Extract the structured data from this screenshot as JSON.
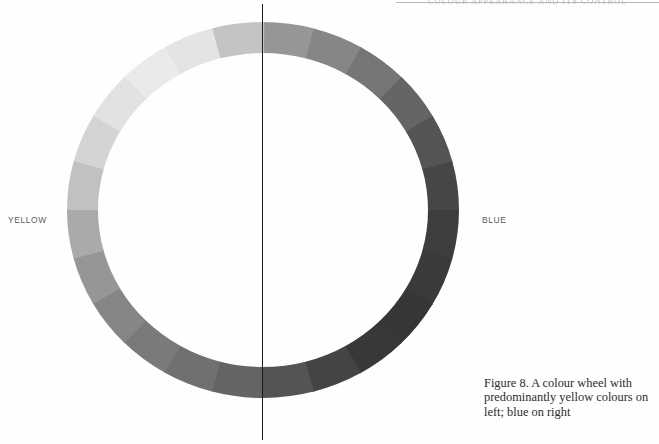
{
  "page": {
    "background_color": "#fefefe",
    "header_rule_color": "#b9b9bd",
    "running_header": "COLOUR APPEARANCE AND ITS CONTROL",
    "divider_color": "#1a1a1a"
  },
  "labels": {
    "left": "YELLOW",
    "right": "BLUE",
    "label_color": "#5b5b5f"
  },
  "caption": {
    "line1": "Figure 8. A colour wheel with",
    "line2": "predominantly yellow colours on",
    "line3": "left; blue on right",
    "full_text": "Figure 8. A colour wheel with predominantly yellow colours on left; blue on right",
    "text_color": "#2b2b2e"
  },
  "chart_data": {
    "type": "pie",
    "title": "A colour wheel with predominantly yellow colours on left; blue on right",
    "subtitle": "",
    "xlabel": "",
    "ylabel": "",
    "legend_position": "sides",
    "grid": false,
    "rendering": "greyscale scan of a colour wheel; lightness encodes the original hue",
    "geometry": {
      "center_x": 199,
      "center_y": 191,
      "outer_radius_x": 196,
      "outer_radius_y": 188,
      "ring_thickness": 31,
      "segment_count": 24,
      "segment_degrees": 15,
      "start_angle_deg": -90
    },
    "annotations": [
      {
        "text": "YELLOW",
        "side": "left",
        "angle_deg": 180
      },
      {
        "text": "BLUE",
        "side": "right",
        "angle_deg": 0
      },
      {
        "text": "vertical divider",
        "angle_deg": 90,
        "color": "#1a1a1a"
      }
    ],
    "categories": [
      "0 (top)",
      "15",
      "30",
      "45",
      "60",
      "75",
      "90 (right / BLUE)",
      "105",
      "120",
      "135",
      "150",
      "165",
      "180 (bottom)",
      "195",
      "210",
      "225",
      "240",
      "255",
      "270 (left / YELLOW)",
      "285",
      "300",
      "315",
      "330",
      "345"
    ],
    "values": [
      1,
      1,
      1,
      1,
      1,
      1,
      1,
      1,
      1,
      1,
      1,
      1,
      1,
      1,
      1,
      1,
      1,
      1,
      1,
      1,
      1,
      1,
      1,
      1
    ],
    "series": [
      {
        "name": "segment greyscale lightness (0-255)",
        "values": [
          150,
          134,
          118,
          101,
          84,
          70,
          62,
          58,
          54,
          56,
          68,
          84,
          100,
          112,
          122,
          134,
          150,
          170,
          193,
          212,
          226,
          234,
          228,
          196
        ]
      }
    ],
    "segment_colors": [
      "#969696",
      "#868686",
      "#767676",
      "#656565",
      "#545454",
      "#464646",
      "#3e3e3e",
      "#3a3a3a",
      "#363636",
      "#383838",
      "#444444",
      "#545454",
      "#646464",
      "#707070",
      "#7a7a7a",
      "#868686",
      "#969696",
      "#aaaaaa",
      "#c1c1c1",
      "#d4d4d4",
      "#e2e2e2",
      "#eaeaea",
      "#e4e4e4",
      "#c4c4c4"
    ],
    "segment_labels": [
      "top",
      "",
      "",
      "",
      "",
      "",
      "right (BLUE)",
      "",
      "",
      "",
      "",
      "",
      "bottom",
      "",
      "",
      "",
      "",
      "",
      "left (YELLOW)",
      "",
      "",
      "",
      "",
      ""
    ]
  }
}
